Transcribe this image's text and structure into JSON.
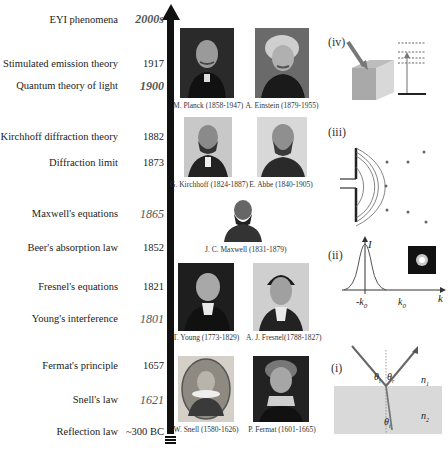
{
  "timeline": {
    "events": [
      {
        "label": "EYI phenomena",
        "year": "2000s",
        "style": "bold-italic"
      },
      {
        "label": "Stimulated emission theory",
        "year": "1917",
        "style": "normal"
      },
      {
        "label": "Quantum theory of light",
        "year": "1900",
        "style": "bold-italic"
      },
      {
        "label": "Kirchhoff diffraction theory",
        "year": "1882",
        "style": "normal"
      },
      {
        "label": "Diffraction limit",
        "year": "1873",
        "style": "normal"
      },
      {
        "label": "Maxwell's  equations",
        "year": "1865",
        "style": "italic"
      },
      {
        "label": "Beer's absorption law",
        "year": "1852",
        "style": "normal"
      },
      {
        "label": "Fresnel's  equations",
        "year": "1821",
        "style": "normal"
      },
      {
        "label": "Young's interference",
        "year": "1801",
        "style": "italic"
      },
      {
        "label": "Fermat's principle",
        "year": "1657",
        "style": "normal"
      },
      {
        "label": "Snell's law",
        "year": "1621",
        "style": "italic"
      },
      {
        "label": "Reflection law",
        "year": "~300 BC",
        "style": "normal"
      }
    ]
  },
  "portraits": [
    {
      "caption": "M. Planck (1858-1947)"
    },
    {
      "caption": "A. Einstein (1879-1955)"
    },
    {
      "caption": "G. Kirchhoff (1824-1887)"
    },
    {
      "caption": "E. Abbe (1840-1905)"
    },
    {
      "caption": "J. C. Maxwell (1831-1879)"
    },
    {
      "caption": "T. Young (1773-1829)"
    },
    {
      "caption": "A. J. Fresnel(1788-1827)"
    },
    {
      "caption": "W. Snell (1580-1626)"
    },
    {
      "caption": "P. Fermat (1601-1665)"
    }
  ],
  "panels": {
    "iv": {
      "label": "(iv)",
      "icon": "stimulated-emission-cube"
    },
    "iii": {
      "label": "(iii)",
      "icon": "diffraction-slit"
    },
    "ii": {
      "label": "(ii)",
      "axis_y": "I",
      "axis_x": "k",
      "tick_neg": "-k",
      "tick_pos": "k",
      "sub": "0"
    },
    "i": {
      "label": "(i)",
      "theta_i": "θ",
      "theta_r": "θ",
      "theta_t": "θ",
      "sub_i": "i",
      "sub_r": "r",
      "sub_t": "t",
      "n1": "n",
      "n2": "n",
      "sub_n1": "1",
      "sub_n2": "2"
    }
  },
  "colors": {
    "axis": "#111111",
    "medium": "#d9d9d9",
    "text": "#222222"
  }
}
